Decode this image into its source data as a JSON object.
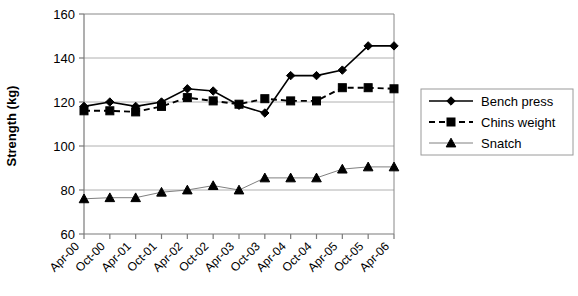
{
  "chart_data": {
    "type": "line",
    "title": "",
    "xlabel": "",
    "ylabel": "Strength (kg)",
    "ylim": [
      60,
      160
    ],
    "ytick_labels": [
      "160",
      "140",
      "120",
      "100",
      "80",
      "60"
    ],
    "yticks": [
      160,
      140,
      120,
      100,
      80,
      60
    ],
    "grid": true,
    "grid_axis": "y",
    "legend_position": "right",
    "categories": [
      "Apr-00",
      "Oct-00",
      "Apr-01",
      "Oct-01",
      "Apr-02",
      "Oct-02",
      "Apr-03",
      "Oct-03",
      "Apr-04",
      "Oct-04",
      "Apr-05",
      "Oct-05",
      "Apr-06"
    ],
    "series": [
      {
        "name": "Bench press",
        "marker": "diamond",
        "line_style": "solid",
        "color": "#000000",
        "values": [
          118,
          120,
          118,
          120,
          126,
          125,
          118.5,
          115,
          132,
          132,
          134.5,
          145.5,
          145.5
        ]
      },
      {
        "name": "Chins weight",
        "marker": "square",
        "line_style": "dashed",
        "color": "#000000",
        "values": [
          116,
          116,
          115.5,
          118,
          122,
          120.5,
          119,
          121.5,
          120.5,
          120.5,
          126.5,
          126.5,
          126
        ]
      },
      {
        "name": "Snatch",
        "marker": "triangle",
        "line_style": "solid-thin",
        "color": "#808080",
        "values": [
          76,
          76.5,
          76.5,
          79,
          80,
          82,
          80,
          85.5,
          85.5,
          85.5,
          89.5,
          90.5,
          90.5
        ]
      }
    ]
  },
  "legend": {
    "items": [
      {
        "label": "Bench press"
      },
      {
        "label": "Chins weight"
      },
      {
        "label": "Snatch"
      }
    ]
  },
  "colors": {
    "plot_border": "#000000",
    "gridline": "#b0b0b0",
    "axis": "#808080",
    "series_dark": "#000000",
    "series_gray": "#808080"
  }
}
